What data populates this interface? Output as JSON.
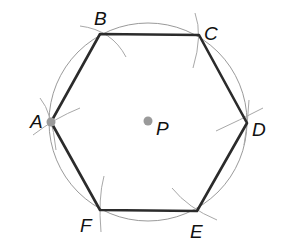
{
  "diagram": {
    "type": "geometric-construction",
    "colors": {
      "hexagon_stroke": "#2b2b2b",
      "circle_stroke": "#9a9a9a",
      "arc_stroke": "#a8a8a8",
      "point_fill": "#9a9a9a",
      "label": "#111111",
      "background": "#ffffff"
    },
    "circle": {
      "center_label": "P",
      "cx": 148,
      "cy": 122,
      "r": 99
    },
    "center": {
      "label": "P",
      "x": 148,
      "y": 121,
      "label_x": 156,
      "label_y": 135
    },
    "vertices": [
      {
        "label": "A",
        "x": 51,
        "y": 122,
        "label_x": 30,
        "label_y": 128
      },
      {
        "label": "B",
        "x": 100,
        "y": 34,
        "label_x": 94,
        "label_y": 25
      },
      {
        "label": "C",
        "x": 199,
        "y": 35,
        "label_x": 204,
        "label_y": 40
      },
      {
        "label": "D",
        "x": 247,
        "y": 123,
        "label_x": 252,
        "label_y": 136
      },
      {
        "label": "E",
        "x": 197,
        "y": 211,
        "label_x": 190,
        "label_y": 238
      },
      {
        "label": "F",
        "x": 100,
        "y": 210,
        "label_x": 80,
        "label_y": 232
      }
    ],
    "marked_points": [
      "A",
      "P"
    ],
    "edges": [
      [
        "A",
        "B"
      ],
      [
        "B",
        "C"
      ],
      [
        "C",
        "D"
      ],
      [
        "D",
        "E"
      ],
      [
        "E",
        "F"
      ],
      [
        "F",
        "A"
      ]
    ]
  }
}
